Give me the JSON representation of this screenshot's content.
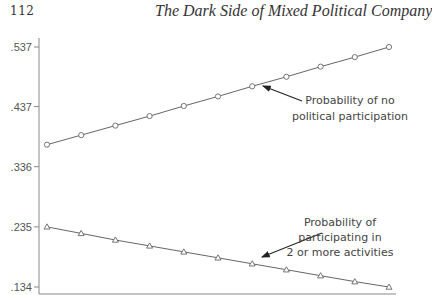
{
  "page": {
    "page_number": "112",
    "running_head": "The Dark Side of Mixed Political Company"
  },
  "chart_data": {
    "type": "line",
    "title": "",
    "xlabel": "",
    "ylabel": "",
    "y_ticks": [
      ".537",
      ".437",
      ".336",
      ".235",
      ".134"
    ],
    "y_tick_values": [
      0.537,
      0.437,
      0.336,
      0.235,
      0.134
    ],
    "ylim": [
      0.127,
      0.545
    ],
    "x": [
      0,
      1,
      2,
      3,
      4,
      5,
      6,
      7,
      8,
      9,
      10
    ],
    "grid": false,
    "legend": "none (inline annotations with arrows)",
    "series": [
      {
        "name": "Probability of no political participation",
        "marker": "circle",
        "values": [
          0.373,
          0.389,
          0.405,
          0.421,
          0.438,
          0.454,
          0.471,
          0.487,
          0.504,
          0.52,
          0.537
        ]
      },
      {
        "name": "Probability of participating in 2 or more activities",
        "marker": "triangle",
        "values": [
          0.235,
          0.224,
          0.213,
          0.203,
          0.193,
          0.183,
          0.173,
          0.163,
          0.153,
          0.143,
          0.134
        ]
      }
    ],
    "annotations": [
      {
        "lines": [
          "Probability of no",
          "political participation"
        ],
        "points_to_series": 0,
        "points_to_index": 6
      },
      {
        "lines": [
          "Probability of",
          "participating in",
          "2 or more activities"
        ],
        "points_to_series": 1,
        "points_to_index": 5
      }
    ],
    "colors": {
      "line": "#666666",
      "axis": "#888888",
      "text": "#444444"
    }
  }
}
